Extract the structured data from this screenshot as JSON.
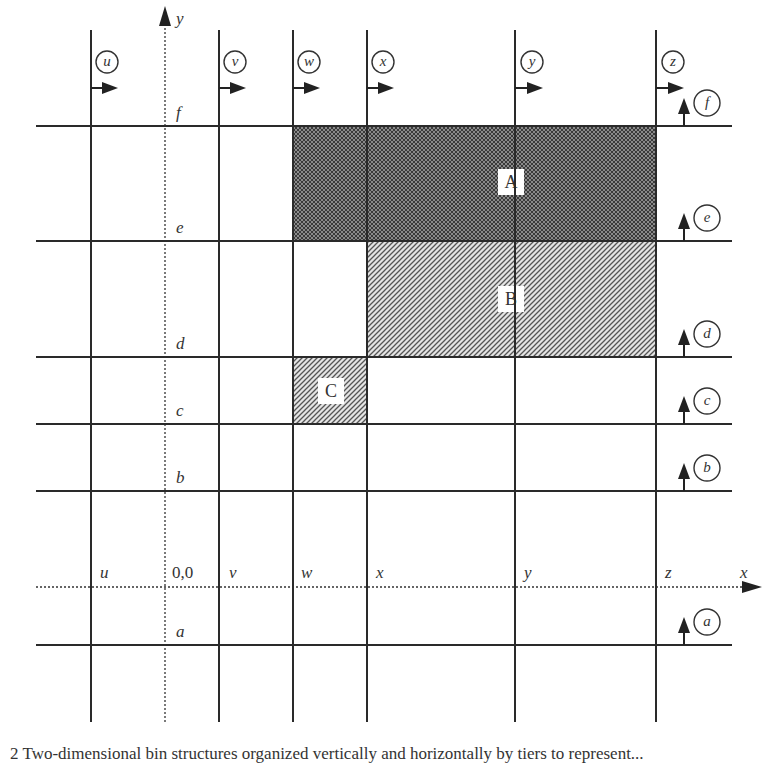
{
  "figure": {
    "axes": {
      "x_label": "x",
      "y_label": "y",
      "origin_label": "0,0",
      "x_axis_y": 587,
      "y_axis_x": 165
    },
    "vertical_tiers": [
      {
        "id": "u",
        "label": "u",
        "x": 91
      },
      {
        "id": "v",
        "label": "v",
        "x": 219
      },
      {
        "id": "w",
        "label": "w",
        "x": 293
      },
      {
        "id": "x",
        "label": "x",
        "x": 367
      },
      {
        "id": "y",
        "label": "y",
        "x": 515
      },
      {
        "id": "z",
        "label": "z",
        "x": 656
      }
    ],
    "horizontal_tiers": [
      {
        "id": "f",
        "label": "f",
        "y": 126
      },
      {
        "id": "e",
        "label": "e",
        "y": 241
      },
      {
        "id": "d",
        "label": "d",
        "y": 357
      },
      {
        "id": "c",
        "label": "c",
        "y": 424
      },
      {
        "id": "b",
        "label": "b",
        "y": 491
      },
      {
        "id": "a",
        "label": "a",
        "y": 645
      }
    ],
    "regions": [
      {
        "id": "A",
        "label": "A",
        "pattern": "crosshatch",
        "from_x": "w",
        "to_x": "z",
        "from_y": "f",
        "to_y": "e"
      },
      {
        "id": "B",
        "label": "B",
        "pattern": "diagonal",
        "from_x": "x",
        "to_x": "z",
        "from_y": "e",
        "to_y": "d"
      },
      {
        "id": "C",
        "label": "C",
        "pattern": "diagonal",
        "from_x": "w",
        "to_x": "x",
        "from_y": "d",
        "to_y": "c"
      }
    ],
    "colors": {
      "line": "#2a2a2a",
      "crosshatch_fill": "#6e6e6e",
      "diagonal_fill": "#9a9a9a"
    }
  },
  "caption": {
    "text": "2    Two-dimensional bin structures organized vertically and horizontally by tiers to represent..."
  }
}
